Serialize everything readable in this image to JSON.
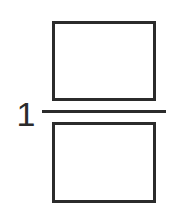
{
  "figure": {
    "kind": "mixed-number-fraction-blank",
    "background_color": "#ffffff",
    "stroke_color": "#2b2b2b"
  },
  "whole_number": {
    "value": "1",
    "name": "whole-number-one"
  },
  "fraction": {
    "numerator": {
      "value": "",
      "label": "empty-numerator-box"
    },
    "denominator": {
      "value": "",
      "label": "empty-denominator-box"
    },
    "bar": {
      "label": "fraction-bar"
    }
  }
}
